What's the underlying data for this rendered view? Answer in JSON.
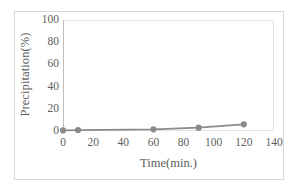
{
  "chart_data": {
    "type": "line",
    "title": "",
    "xlabel": "Time(min.)",
    "ylabel": "Precipitation(%)",
    "xlim": [
      0,
      140
    ],
    "ylim": [
      0,
      100
    ],
    "xticks": [
      0,
      20,
      40,
      60,
      80,
      100,
      120,
      140
    ],
    "yticks": [
      0,
      20,
      40,
      60,
      80,
      100
    ],
    "grid": false,
    "legend": null,
    "legend_position": "none",
    "series": [
      {
        "name": "Precipitation",
        "marker": "circle",
        "color": "#8a8a8a",
        "x": [
          0,
          10,
          60,
          90,
          120
        ],
        "y": [
          0.5,
          0.8,
          1.5,
          3.0,
          6.0
        ]
      }
    ]
  },
  "axes": {
    "x_tick_labels": [
      "0",
      "20",
      "40",
      "60",
      "80",
      "100",
      "120",
      "140"
    ],
    "y_tick_labels": [
      "0",
      "20",
      "40",
      "60",
      "80",
      "100"
    ],
    "x_title": "Time(min.)",
    "y_title": "Precipitation(%)"
  },
  "style": {
    "series_color": "#8a8a8a",
    "axis_text_color": "#5e5e5e",
    "frame_color": "#d8d8d8",
    "plot_border_color": "#e2e2e2",
    "background": "#ffffff"
  }
}
